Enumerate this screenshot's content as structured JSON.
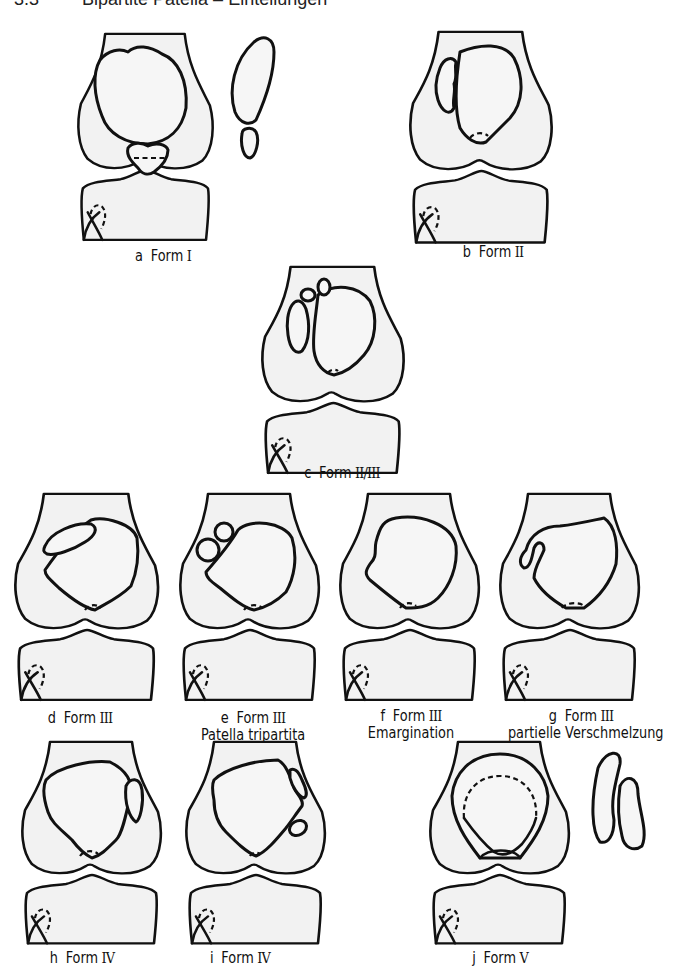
{
  "header": {
    "number": "3.3",
    "title": "Bipartite Patella – Einteilungen",
    "note": "header line is clipped at top edge of image"
  },
  "figure": {
    "panels": [
      {
        "id": "a",
        "letter": "a",
        "form": "Form",
        "roman": "I",
        "subtitle": "",
        "extra": "lateral view of patella with separate lower pole fragment"
      },
      {
        "id": "b",
        "letter": "b",
        "form": "Form",
        "roman": "II",
        "subtitle": "",
        "extra": "lateral vertical fragment"
      },
      {
        "id": "c",
        "letter": "c",
        "form": "Form",
        "roman": "II/III",
        "subtitle": "",
        "extra": "lateral fragment plus two small superolateral ossicles"
      },
      {
        "id": "d",
        "letter": "d",
        "form": "Form",
        "roman": "III",
        "subtitle": "",
        "extra": "oblong superolateral fragment"
      },
      {
        "id": "e",
        "letter": "e",
        "form": "Form",
        "roman": "III",
        "subtitle": "Patella tripartita",
        "extra": "two round superolateral fragments"
      },
      {
        "id": "f",
        "letter": "f",
        "form": "Form",
        "roman": "III",
        "subtitle": "Emargination",
        "extra": "superolateral notch"
      },
      {
        "id": "g",
        "letter": "g",
        "form": "Form",
        "roman": "III",
        "subtitle": "partielle Verschmelzung",
        "extra": "partially fused superolateral fragment"
      },
      {
        "id": "h",
        "letter": "h",
        "form": "Form",
        "roman": "IV",
        "subtitle": "",
        "extra": "medial vertical fragment"
      },
      {
        "id": "i",
        "letter": "i",
        "form": "Form",
        "roman": "IV",
        "subtitle": "",
        "extra": "medial fragments (elongated + round)"
      },
      {
        "id": "j",
        "letter": "j",
        "form": "Form",
        "roman": "V",
        "subtitle": "",
        "extra": "patella duplex – two patellae, lateral view with two stacked patellae"
      }
    ]
  },
  "colors": {
    "stroke": "#111111",
    "bone_fill": "#f2f2f2",
    "background": "#ffffff"
  }
}
